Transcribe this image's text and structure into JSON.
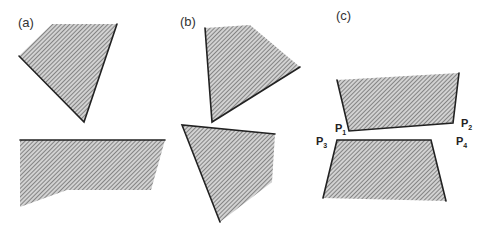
{
  "figure": {
    "panels": [
      {
        "id": "a",
        "label": "(a)",
        "shapes": [
          {
            "name": "top-polygon",
            "points": "52,24 117,24 84,122 19,56",
            "bold_edges": [
              [
                19,
                56,
                84,
                122
              ],
              [
                84,
                122,
                117,
                24
              ]
            ]
          },
          {
            "name": "bottom-polygon",
            "points": "20,140 165,140 151,190 67,190 20,207",
            "bold_edges": [
              [
                20,
                140,
                165,
                140
              ]
            ]
          }
        ]
      },
      {
        "id": "b",
        "label": "(b)",
        "shapes": [
          {
            "name": "top-polygon",
            "points": "205,28 250,25 300,67 212,122",
            "bold_edges": [
              [
                205,
                28,
                212,
                122
              ],
              [
                212,
                122,
                300,
                67
              ]
            ]
          },
          {
            "name": "bottom-polygon",
            "points": "182,125 275,134 272,182 220,222",
            "bold_edges": [
              [
                182,
                125,
                275,
                134
              ],
              [
                182,
                125,
                220,
                222
              ]
            ]
          }
        ]
      },
      {
        "id": "c",
        "label": "(c)",
        "shapes": [
          {
            "name": "top-polygon",
            "points": "337,80 459,73 453,123 349,131",
            "bold_edges": [
              [
                337,
                80,
                349,
                131
              ],
              [
                349,
                131,
                453,
                123
              ],
              [
                453,
                123,
                459,
                73
              ]
            ]
          },
          {
            "name": "bottom-polygon",
            "points": "337,140 431,140 446,201 323,198",
            "bold_edges": [
              [
                323,
                198,
                337,
                140
              ],
              [
                337,
                140,
                431,
                140
              ],
              [
                431,
                140,
                446,
                201
              ]
            ]
          }
        ],
        "points": [
          {
            "main": "P",
            "sub": "1",
            "x": 335,
            "y": 132
          },
          {
            "main": "P",
            "sub": "2",
            "x": 461,
            "y": 127
          },
          {
            "main": "P",
            "sub": "3",
            "x": 316,
            "y": 145
          },
          {
            "main": "P",
            "sub": "4",
            "x": 456,
            "y": 145
          }
        ]
      }
    ],
    "colors": {
      "fill_base": "#c8c8c8",
      "hatch": "#555555",
      "edge": "#222222"
    }
  }
}
